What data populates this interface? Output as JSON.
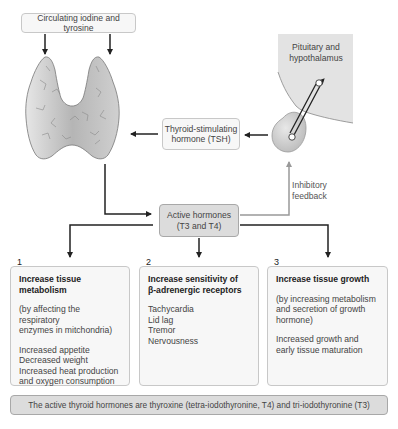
{
  "diagram": {
    "input_box": "Circulating iodine and tyrosine",
    "pituitary_label_line1": "Pituitary and",
    "pituitary_label_line2": "hypothalamus",
    "tsh_box_line1": "Thyroid-stimulating",
    "tsh_box_line2": "hormone (TSH)",
    "active_box_line1": "Active hormones",
    "active_box_line2": "(T3 and T4)",
    "feedback_label_line1": "Inhibitory",
    "feedback_label_line2": "feedback",
    "effects": [
      {
        "number": "1",
        "title": "Increase tissue metabolism",
        "note_line1": "(by affecting the respiratory",
        "note_line2": "enzymes in mitchondria)",
        "items": [
          "Increased appetite",
          "Decreased weight",
          "Increased heat production",
          "and oxygen consumption"
        ]
      },
      {
        "number": "2",
        "title_line1": "Increase sensitivity of",
        "title_line2": "β-adrenergic receptors",
        "items": [
          "Tachycardia",
          "Lid lag",
          "Tremor",
          "Nervousness"
        ]
      },
      {
        "number": "3",
        "title": "Increase tissue growth",
        "note_line1": "(by increasing metabolism",
        "note_line2": "and secretion of growth",
        "note_line3": "hormone)",
        "items": [
          "Increased growth and",
          "early tissue maturation"
        ]
      }
    ],
    "footer": "The active thyroid hormones are thyroxine (tetra-iodothyronine, T4) and tri-iodothyronine (T3)",
    "colors": {
      "box_fill": "#f7f7f7",
      "active_fill": "#dcdcdc",
      "organ_fill": "#c4c4c4",
      "pituitary_region": "#e3e3e3",
      "arrow_dark": "#222222",
      "arrow_gray": "#999999"
    }
  }
}
